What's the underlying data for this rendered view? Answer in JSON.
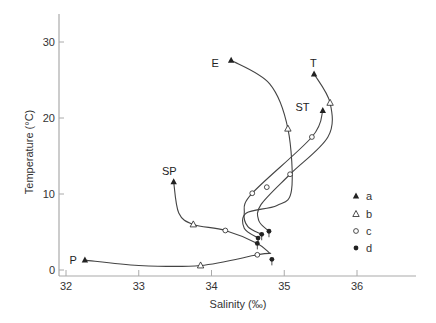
{
  "chart_data": {
    "type": "scatter",
    "title": "",
    "xlabel": "Salinity (‰)",
    "ylabel": "Temperature (°C)",
    "xlim": [
      32,
      36.8
    ],
    "ylim": [
      -0.5,
      33
    ],
    "xticks": [
      32,
      33,
      34,
      35,
      36
    ],
    "yticks": [
      0,
      10,
      20,
      30
    ],
    "grid": false,
    "legend": {
      "placement": "lower-right",
      "entries": [
        {
          "key": "a",
          "label": "a",
          "marker": "filled-triangle"
        },
        {
          "key": "b",
          "label": "b",
          "marker": "open-triangle"
        },
        {
          "key": "c",
          "label": "c",
          "marker": "open-circle"
        },
        {
          "key": "d",
          "label": "d",
          "marker": "filled-circle"
        }
      ]
    },
    "curves": [
      {
        "name": "P",
        "label": "P",
        "points": [
          [
            32.26,
            1.3
          ],
          [
            33.0,
            0.6
          ],
          [
            33.85,
            0.6
          ],
          [
            34.63,
            2.0
          ],
          [
            34.82,
            2.2
          ]
        ]
      },
      {
        "name": "SP",
        "label": "SP",
        "points": [
          [
            33.48,
            11.6
          ],
          [
            33.55,
            7.5
          ],
          [
            33.75,
            6.0
          ],
          [
            34.19,
            5.2
          ],
          [
            34.63,
            3.5
          ],
          [
            34.8,
            2.2
          ]
        ]
      },
      {
        "name": "E",
        "label": "E",
        "points": [
          [
            34.27,
            27.6
          ],
          [
            34.8,
            24.5
          ],
          [
            35.05,
            18.6
          ],
          [
            35.1,
            10.5
          ],
          [
            34.9,
            8.5
          ],
          [
            34.48,
            7.5
          ],
          [
            34.45,
            5.5
          ],
          [
            34.64,
            4.2
          ]
        ]
      },
      {
        "name": "T",
        "label": "T",
        "points": [
          [
            35.41,
            25.8
          ],
          [
            35.63,
            22.0
          ],
          [
            35.6,
            17.5
          ],
          [
            35.08,
            12.6
          ],
          [
            34.68,
            8.6
          ],
          [
            34.65,
            6.5
          ],
          [
            34.79,
            5.1
          ]
        ]
      },
      {
        "name": "ST",
        "label": "ST",
        "points": [
          [
            35.53,
            21.0
          ],
          [
            35.38,
            17.5
          ],
          [
            34.56,
            10.1
          ],
          [
            34.45,
            7.5
          ],
          [
            34.5,
            5.7
          ],
          [
            34.69,
            4.7
          ]
        ]
      }
    ],
    "markers": [
      {
        "type": "a",
        "x": 32.26,
        "y": 1.3
      },
      {
        "type": "a",
        "x": 33.48,
        "y": 11.6
      },
      {
        "type": "a",
        "x": 34.27,
        "y": 27.6
      },
      {
        "type": "a",
        "x": 35.41,
        "y": 25.8
      },
      {
        "type": "a",
        "x": 35.53,
        "y": 21.0
      },
      {
        "type": "b",
        "x": 33.85,
        "y": 0.6
      },
      {
        "type": "b",
        "x": 33.75,
        "y": 6.0
      },
      {
        "type": "b",
        "x": 35.05,
        "y": 18.6
      },
      {
        "type": "b",
        "x": 35.63,
        "y": 22.0
      },
      {
        "type": "c",
        "x": 34.63,
        "y": 2.0
      },
      {
        "type": "c",
        "x": 34.19,
        "y": 5.2
      },
      {
        "type": "c",
        "x": 35.38,
        "y": 17.5
      },
      {
        "type": "c",
        "x": 34.56,
        "y": 10.1
      },
      {
        "type": "c",
        "x": 35.08,
        "y": 12.6
      },
      {
        "type": "c",
        "x": 34.76,
        "y": 10.9
      },
      {
        "type": "d",
        "x": 34.63,
        "y": 3.5
      },
      {
        "type": "d",
        "x": 34.64,
        "y": 4.2
      },
      {
        "type": "d",
        "x": 34.69,
        "y": 4.7
      },
      {
        "type": "d",
        "x": 34.79,
        "y": 5.1
      },
      {
        "type": "d",
        "x": 34.83,
        "y": 1.4
      }
    ],
    "annotations": [
      {
        "text": "P",
        "x": 32.1,
        "y": 1.3
      },
      {
        "text": "SP",
        "x": 33.42,
        "y": 13.0
      },
      {
        "text": "E",
        "x": 34.05,
        "y": 27.3
      },
      {
        "text": "T",
        "x": 35.4,
        "y": 27.3
      },
      {
        "text": "ST",
        "x": 35.25,
        "y": 21.4
      }
    ],
    "colors": {
      "line": "#444444",
      "marker": "#222222",
      "axis": "#aaaaaa"
    }
  }
}
